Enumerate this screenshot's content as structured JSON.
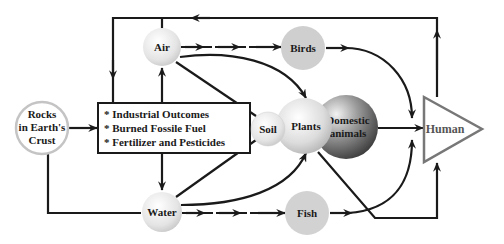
{
  "diagram": {
    "title": "",
    "nodes": {
      "rocks": {
        "lines": [
          "Rocks",
          "in Earth's",
          "Crust"
        ]
      },
      "air": {
        "label": "Air"
      },
      "water": {
        "label": "Water"
      },
      "soil": {
        "label": "Soil"
      },
      "plants": {
        "label": "Plants"
      },
      "domestic": {
        "lines": [
          "Domestic",
          "animals"
        ]
      },
      "birds": {
        "label": "Birds"
      },
      "fish": {
        "label": "Fish"
      },
      "human": {
        "label": "Human"
      }
    },
    "sources_box": {
      "items": [
        "* Industrial Outcomes",
        "* Burned Fossile Fuel",
        "* Fertilizer and Pesticides"
      ]
    },
    "edges": [
      {
        "from": "Rocks in Earth's Crust",
        "to": "Sources box"
      },
      {
        "from": "Rocks in Earth's Crust",
        "to": "Water"
      },
      {
        "from": "Sources box",
        "to": "Air"
      },
      {
        "from": "Sources box",
        "to": "Water"
      },
      {
        "from": "Sources box",
        "to": "Soil"
      },
      {
        "from": "Air",
        "to": "Birds"
      },
      {
        "from": "Air",
        "to": "Plants"
      },
      {
        "from": "Air",
        "to": "Soil"
      },
      {
        "from": "Water",
        "to": "Fish"
      },
      {
        "from": "Water",
        "to": "Plants"
      },
      {
        "from": "Water",
        "to": "Soil"
      },
      {
        "from": "Birds",
        "to": "Human"
      },
      {
        "from": "Fish",
        "to": "Human"
      },
      {
        "from": "Domestic animals",
        "to": "Human"
      },
      {
        "from": "Plants",
        "to": "Human"
      },
      {
        "from": "Human",
        "to": "Air (feedback loop)"
      }
    ],
    "colors": {
      "line": "#1a1a1a",
      "light_node": "#e6e6e6",
      "birds_fish": "#cfcfcf",
      "domestic_dark": "#555555",
      "human_outline": "#777777"
    }
  }
}
